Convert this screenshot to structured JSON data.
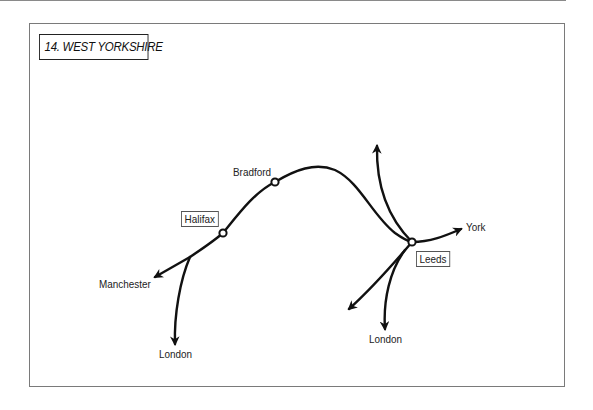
{
  "title": "14. WEST YORKSHIRE",
  "colors": {
    "line": "#111111",
    "frame": "#7a7a7a",
    "background": "#ffffff"
  },
  "stations": [
    {
      "name": "Halifax",
      "boxed": true
    },
    {
      "name": "Bradford",
      "boxed": false
    },
    {
      "name": "Leeds",
      "boxed": true
    }
  ],
  "destinations": {
    "manchester": "Manchester",
    "london_west": "London",
    "london_east": "London",
    "york": "York"
  },
  "labels": {
    "halifax": "Halifax",
    "bradford": "Bradford",
    "leeds": "Leeds"
  }
}
